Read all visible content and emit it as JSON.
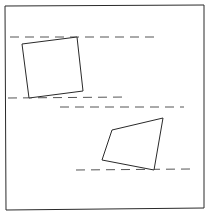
{
  "diagram": {
    "stroke_color": "#2a2a2a",
    "dash_color": "#555555",
    "frame": {
      "points": "5,6 204,5 204,208 6,210"
    },
    "squares": [
      {
        "id": "square-upper-left",
        "points": "22,44 77,37 83,91 29,98"
      },
      {
        "id": "square-lower-right",
        "points": "112,130 163,118 154,170 102,160"
      }
    ],
    "dashed_lines": [
      {
        "id": "dashed-line-1",
        "x1": 10,
        "y1": 37,
        "x2": 156,
        "y2": 37
      },
      {
        "id": "dashed-line-2",
        "x1": 8,
        "y1": 98,
        "x2": 128,
        "y2": 97
      },
      {
        "id": "dashed-line-3",
        "x1": 60,
        "y1": 107,
        "x2": 184,
        "y2": 107
      },
      {
        "id": "dashed-line-4",
        "x1": 76,
        "y1": 170,
        "x2": 190,
        "y2": 169
      }
    ]
  }
}
